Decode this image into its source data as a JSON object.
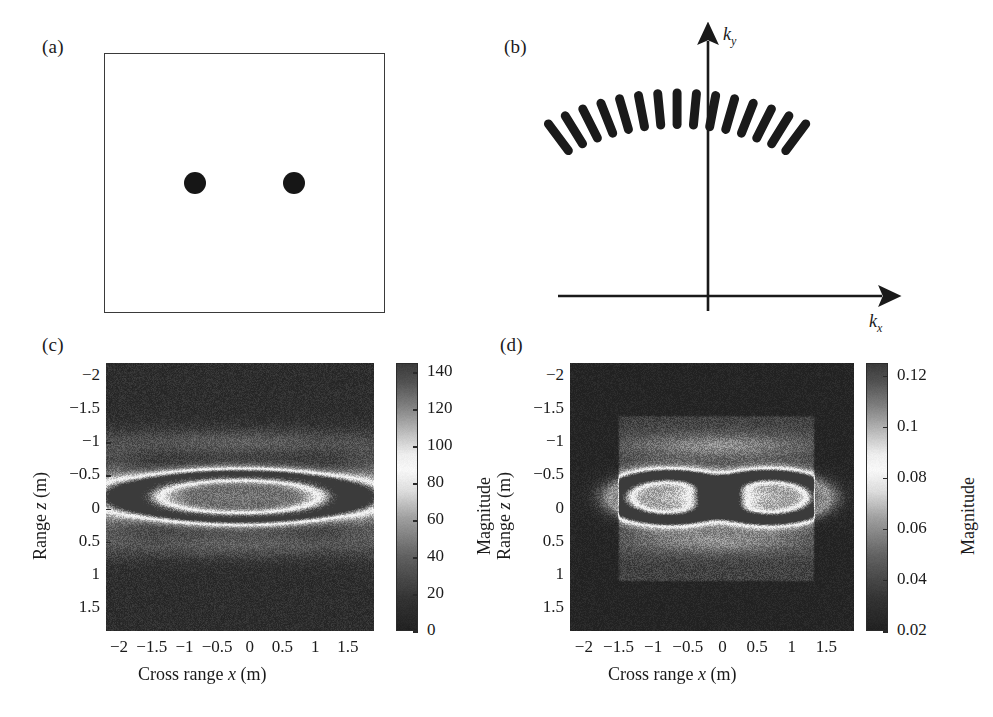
{
  "figure": {
    "panels": [
      {
        "id": "a",
        "label": "(a)"
      },
      {
        "id": "b",
        "label": "(b)"
      },
      {
        "id": "c",
        "label": "(c)"
      },
      {
        "id": "d",
        "label": "(d)"
      }
    ]
  },
  "panel_a": {
    "label": "(a)",
    "description": "Two point scatterers in a rectangular scene"
  },
  "panel_b": {
    "label": "(b)",
    "axis_x_label_k": "k",
    "axis_x_label_sub": "x",
    "axis_y_label_k": "k",
    "axis_y_label_sub": "y"
  },
  "panel_c": {
    "label": "(c)",
    "xlabel_prefix": "Cross range ",
    "xlabel_var": "x",
    "xlabel_unit": " (m)",
    "ylabel_prefix": "Range ",
    "ylabel_var": "z",
    "ylabel_unit": " (m)",
    "colorbar_label": "Magnitude"
  },
  "panel_d": {
    "label": "(d)",
    "xlabel_prefix": "Cross range ",
    "xlabel_var": "x",
    "xlabel_unit": " (m)",
    "ylabel_prefix": "Range ",
    "ylabel_var": "z",
    "ylabel_unit": " (m)",
    "colorbar_label": "Magnitude"
  },
  "chart_data": [
    {
      "panel": "a",
      "type": "scatter",
      "title": "(a)",
      "xlabel": "",
      "ylabel": "",
      "grid": false,
      "legend": "none",
      "frame": true,
      "background": "#ffffff",
      "marker_color": "#161616",
      "points": [
        {
          "x": -0.5,
          "y": 0.0
        },
        {
          "x": 0.5,
          "y": 0.0
        }
      ],
      "xlim": [
        -1.4,
        1.4
      ],
      "ylim": [
        -1.3,
        1.3
      ]
    },
    {
      "panel": "b",
      "type": "scatter",
      "title": "(b)",
      "xlabel": "k_x",
      "ylabel": "k_y",
      "grid": false,
      "legend": "none",
      "note": "Arc of radial k-space support segments above the origin",
      "arc": {
        "center_x": 0.0,
        "center_y": -1.55,
        "radius": 2.5,
        "angle_start_deg": 58,
        "angle_end_deg": 122,
        "n_segments": 15,
        "segment_length": 0.42,
        "segment_thickness": 0.1,
        "color": "#1a1a1a"
      },
      "xlim": [
        -2.2,
        2.6
      ],
      "ylim": [
        -2.2,
        2.2
      ]
    },
    {
      "panel": "c",
      "type": "heatmap",
      "title": "(c)",
      "xlabel": "Cross range x (m)",
      "ylabel": "Range z (m)",
      "colorbar_label": "Magnitude",
      "colormap": "grayscale-banded",
      "grid": false,
      "legend": "colorbar-right",
      "x_ticks": [
        -2,
        -1.5,
        -1,
        -0.5,
        0,
        0.5,
        1,
        1.5
      ],
      "x_tick_labels": [
        "−2",
        "−1.5",
        "−1",
        "−0.5",
        "0",
        "0.5",
        "1",
        "1.5"
      ],
      "y_ticks": [
        -2,
        -1.5,
        -1,
        -0.5,
        0,
        0.5,
        1,
        1.5
      ],
      "y_tick_labels": [
        "−2",
        "−1.5",
        "−1",
        "−0.5",
        "0",
        "0.5",
        "1",
        "1.5"
      ],
      "xlim": [
        -2.2,
        1.9
      ],
      "ylim": [
        1.85,
        -2.2
      ],
      "y_axis_inverted": true,
      "colorbar_ticks": [
        0,
        20,
        40,
        60,
        80,
        100,
        120,
        140
      ],
      "colorbar_tick_labels": [
        "0",
        "20",
        "40",
        "60",
        "80",
        "100",
        "120",
        "140"
      ],
      "clim": [
        0,
        145
      ],
      "features": {
        "kind": "single-wide-elliptical-ring",
        "ring_center_x": -0.15,
        "ring_center_z": -0.18,
        "ring_semi_x": 1.65,
        "ring_semi_z": 0.33,
        "ring_peak_magnitude": 130,
        "interior_magnitude": 35,
        "background_magnitude": 12,
        "sidelobe_rows_z": [
          -1.0,
          0.55
        ],
        "noise_level": 9
      }
    },
    {
      "panel": "d",
      "type": "heatmap",
      "title": "(d)",
      "xlabel": "Cross range x (m)",
      "ylabel": "Range z (m)",
      "colorbar_label": "Magnitude",
      "colormap": "grayscale-banded",
      "grid": false,
      "legend": "colorbar-right",
      "x_ticks": [
        -2,
        -1.5,
        -1,
        -0.5,
        0,
        0.5,
        1,
        1.5
      ],
      "x_tick_labels": [
        "−2",
        "−1.5",
        "−1",
        "−0.5",
        "0",
        "0.5",
        "1",
        "1.5"
      ],
      "y_ticks": [
        -2,
        -1.5,
        -1,
        -0.5,
        0,
        0.5,
        1,
        1.5
      ],
      "y_tick_labels": [
        "−2",
        "−1.5",
        "−1",
        "−0.5",
        "0",
        "0.5",
        "1",
        "1.5"
      ],
      "xlim": [
        -2.2,
        1.9
      ],
      "ylim": [
        1.85,
        -2.2
      ],
      "y_axis_inverted": true,
      "colorbar_ticks": [
        0.02,
        0.04,
        0.06,
        0.08,
        0.1,
        0.12
      ],
      "colorbar_tick_labels": [
        "0.02",
        "0.04",
        "0.06",
        "0.08",
        "0.1",
        "0.12"
      ],
      "clim": [
        0.02,
        0.125
      ],
      "features": {
        "kind": "two-resolved-rings-figure-eight",
        "inner_window_x": [
          -1.52,
          1.35
        ],
        "inner_window_z": [
          -1.42,
          1.12
        ],
        "ring_left_center_x": -0.78,
        "ring_right_center_x": 0.68,
        "ring_center_z": -0.17,
        "ring_semi_x": 0.78,
        "ring_semi_z": 0.33,
        "ring_peak_magnitude": 0.115,
        "interior_magnitude": 0.05,
        "background_magnitude": 0.022,
        "sidelobe_rows_z": [
          -0.95,
          0.5
        ],
        "noise_level": 0.006
      }
    }
  ]
}
